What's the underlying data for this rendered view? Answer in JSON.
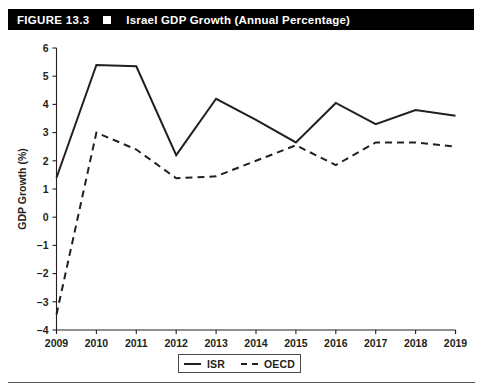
{
  "figure": {
    "number": "FIGURE 13.3",
    "marker": "white-square-bullet",
    "title": "Israel GDP Growth (Annual Percentage)"
  },
  "legend": {
    "position": "bottom-center",
    "entries": [
      {
        "label": "ISR",
        "style": "solid"
      },
      {
        "label": "OECD",
        "style": "dashed"
      }
    ]
  },
  "colors": {
    "ink": "#231f20",
    "bar_background": "#000000",
    "bar_text": "#ffffff",
    "plot_background": "#ffffff"
  },
  "chart_data": {
    "type": "line",
    "title": "Israel GDP Growth (Annual Percentage)",
    "xlabel": "",
    "ylabel": "GDP Growth (%)",
    "x": [
      2009,
      2010,
      2011,
      2012,
      2013,
      2014,
      2015,
      2016,
      2017,
      2018,
      2019
    ],
    "xtick_labels": [
      "2009",
      "2010",
      "2011",
      "2012",
      "2013",
      "2014",
      "2015",
      "2016",
      "2017",
      "2018",
      "2019"
    ],
    "ytick_labels": [
      "6",
      "5",
      "4",
      "3",
      "2",
      "1",
      "0",
      "-1",
      "-2",
      "-3",
      "-4"
    ],
    "yticks": [
      6,
      5,
      4,
      3,
      2,
      1,
      0,
      -1,
      -2,
      -3,
      -4
    ],
    "ylim": [
      -4,
      6
    ],
    "xlim": [
      2009,
      2019
    ],
    "grid": false,
    "legend_position": "bottom-center",
    "series": [
      {
        "name": "ISR",
        "style": "solid",
        "values": [
          1.4,
          5.4,
          5.35,
          2.2,
          4.2,
          3.45,
          2.65,
          4.05,
          3.3,
          3.8,
          3.6
        ]
      },
      {
        "name": "OECD",
        "style": "dashed",
        "values": [
          -3.45,
          3.0,
          2.4,
          1.38,
          1.45,
          2.0,
          2.55,
          1.85,
          2.65,
          2.65,
          2.5
        ]
      }
    ]
  }
}
